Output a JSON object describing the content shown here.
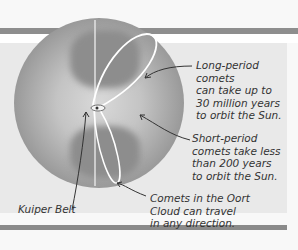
{
  "diagram": {
    "labels": {
      "long_period": [
        "Long-period comets",
        "can take up to",
        "30 million years",
        "to orbit the Sun."
      ],
      "short_period": [
        "Short-period",
        "comets take less",
        "than 200 years",
        "to orbit the Sun."
      ],
      "oort_cloud": [
        "Comets in the Oort",
        "Cloud can travel",
        "in any direction."
      ],
      "kuiper_belt": "Kuiper Belt"
    },
    "colors": {
      "panel": "#e9e9e9",
      "bar": "#8e8e8e",
      "text": "#333333",
      "orbit": "#ffffff"
    }
  }
}
